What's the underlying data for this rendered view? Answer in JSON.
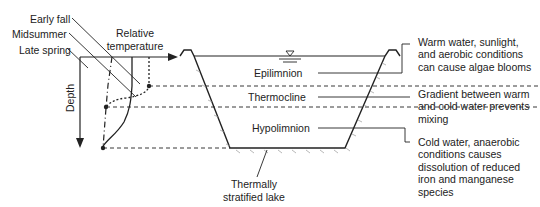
{
  "diagram": {
    "title": "Thermally stratified lake",
    "profile": {
      "axis_x_label": [
        "Relative",
        "temperature"
      ],
      "axis_y_label": "Depth",
      "curves": [
        "Early fall",
        "Midsummer",
        "Late spring"
      ]
    },
    "layers": [
      "Epilimnion",
      "Thermocline",
      "Hypolimnion"
    ],
    "lake_label": [
      "Thermally",
      "stratified lake"
    ],
    "notes": [
      [
        "Warm water, sunlight,",
        "and aerobic conditions",
        "can cause algae blooms"
      ],
      [
        "Gradient between warm",
        "and cold water prevents",
        "mixing"
      ],
      [
        "Cold water, anaerobic",
        "conditions causes",
        "dissolution of reduced",
        "iron and manganese",
        "species"
      ]
    ],
    "water_surface_symbol": "∇"
  }
}
